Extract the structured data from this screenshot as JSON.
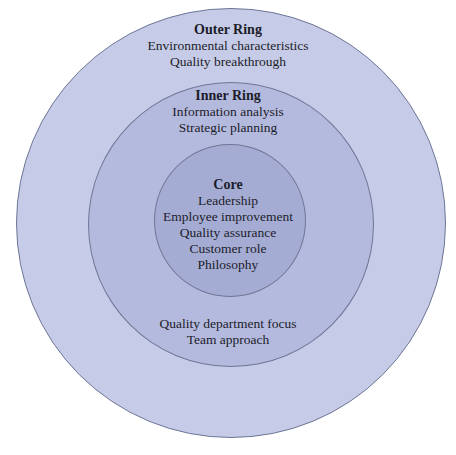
{
  "diagram": {
    "type": "concentric-rings",
    "colors": {
      "outer_ring": "#c6cce7",
      "inner_ring": "#b4bade",
      "core": "#a5acd4",
      "border": "#6f7696",
      "text": "#1c1c2a"
    },
    "outer_ring": {
      "title": "Outer Ring",
      "items": [
        "Environmental characteristics",
        "Quality breakthrough"
      ]
    },
    "inner_ring": {
      "title": "Inner Ring",
      "items_top": [
        "Information analysis",
        "Strategic planning"
      ],
      "items_bottom": [
        "Quality department focus",
        "Team approach"
      ]
    },
    "core": {
      "title": "Core",
      "items": [
        "Leadership",
        "Employee improvement",
        "Quality assurance",
        "Customer role",
        "Philosophy"
      ]
    }
  }
}
